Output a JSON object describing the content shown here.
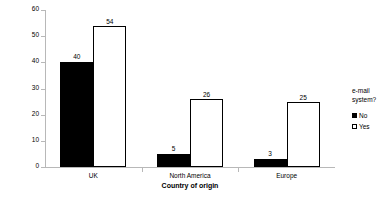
{
  "chart_data": {
    "type": "bar",
    "title": "",
    "subtitle": "",
    "xlabel": "Country of origin",
    "ylabel": "Number of respondents",
    "categories": [
      "UK",
      "North America",
      "Europe"
    ],
    "series": [
      {
        "name": "No",
        "values": [
          40,
          5,
          3
        ],
        "color": "#000000",
        "fill": "solid"
      },
      {
        "name": "Yes",
        "values": [
          54,
          26,
          25
        ],
        "color": "#ffffff",
        "fill": "outline"
      }
    ],
    "ylim": [
      0,
      60
    ],
    "yticks": [
      0,
      10,
      20,
      30,
      40,
      50,
      60
    ],
    "ytick_labels": [
      "0",
      "10",
      "20",
      "30",
      "40",
      "50",
      "60"
    ],
    "grid": false,
    "data_labels": true,
    "legend": {
      "position": "right",
      "title_lines": [
        "e-mail",
        "system?"
      ],
      "entries": [
        {
          "label": "No",
          "swatch": "fill-black"
        },
        {
          "label": "Yes",
          "swatch": "fill-white"
        }
      ]
    },
    "axis_color": "#b8b8b8",
    "background": "#ffffff"
  }
}
